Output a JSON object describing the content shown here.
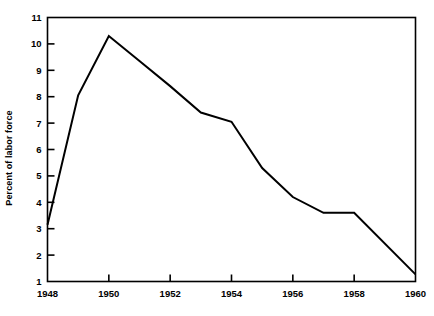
{
  "chart_data": {
    "type": "line",
    "title": "",
    "xlabel": "",
    "ylabel": "Percent of labor force",
    "xlim": [
      1948,
      1960
    ],
    "ylim": [
      1,
      11
    ],
    "grid": false,
    "legend": null,
    "x_ticks": [
      1948,
      1949,
      1950,
      1951,
      1952,
      1953,
      1954,
      1955,
      1956,
      1957,
      1958,
      1959,
      1960
    ],
    "x_tick_labels": [
      "1948",
      "",
      "1950",
      "",
      "1952",
      "",
      "1954",
      "",
      "1956",
      "",
      "1958",
      "",
      "1960"
    ],
    "y_ticks": [
      1,
      2,
      3,
      4,
      5,
      6,
      7,
      8,
      9,
      10,
      11
    ],
    "y_tick_labels": [
      "1",
      "2",
      "3",
      "4",
      "5",
      "6",
      "7",
      "8",
      "9",
      "10",
      "11"
    ],
    "series": [
      {
        "name": "Percent of labor force",
        "color": "#000000",
        "x": [
          1948,
          1949,
          1950,
          1951,
          1952,
          1953,
          1954,
          1955,
          1956,
          1957,
          1958,
          1960
        ],
        "values": [
          3.15,
          8.05,
          10.3,
          9.35,
          8.4,
          7.4,
          7.05,
          5.3,
          4.2,
          3.6,
          3.6,
          1.27
        ]
      }
    ]
  },
  "axes": {
    "y_title": "Percent of labor force"
  }
}
